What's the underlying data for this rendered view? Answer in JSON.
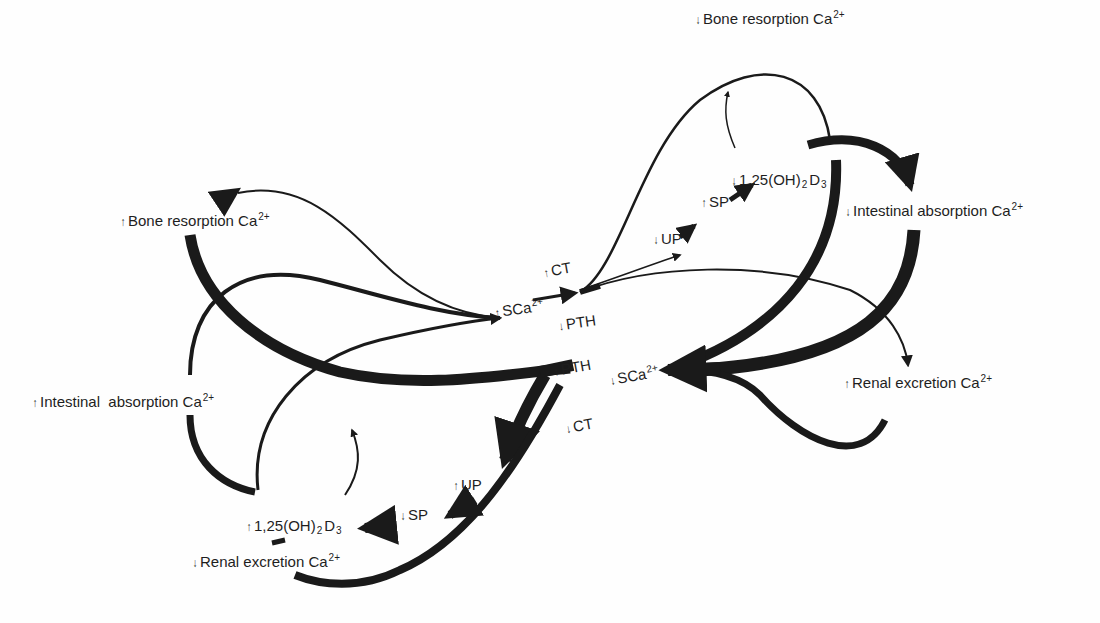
{
  "diagram": {
    "type": "feedback-loop-diagram",
    "upper_loop": {
      "center_node": {
        "arrow": "up",
        "text": "SCa",
        "superscript": "2+"
      },
      "hormone_up": {
        "arrow": "up",
        "text": "CT"
      },
      "hormone_down": {
        "arrow": "down",
        "text": "PTH"
      },
      "chain": [
        {
          "arrow": "down",
          "text": "UP"
        },
        {
          "arrow": "up",
          "text": "SP"
        },
        {
          "arrow": "down",
          "text": "1,25(OH)",
          "subscript": "2",
          "suffix": "D",
          "suffix_subscript": "3"
        }
      ],
      "effects": [
        {
          "arrow": "down",
          "text": "Bone resorption Ca",
          "superscript": "2+"
        },
        {
          "arrow": "down",
          "text": "Intestinal absorption Ca",
          "superscript": "2+"
        },
        {
          "arrow": "up",
          "text": "Renal excretion Ca",
          "superscript": "2+"
        }
      ]
    },
    "lower_loop": {
      "center_node": {
        "arrow": "down",
        "text": "SCa",
        "superscript": "2+"
      },
      "hormone_up": {
        "arrow": "up",
        "text": "PTH"
      },
      "hormone_down": {
        "arrow": "down",
        "text": "CT"
      },
      "chain": [
        {
          "arrow": "up",
          "text": "UP"
        },
        {
          "arrow": "down",
          "text": "SP"
        },
        {
          "arrow": "up",
          "text": "1,25(OH)",
          "subscript": "2",
          "suffix": "D",
          "suffix_subscript": "3"
        }
      ],
      "effects": [
        {
          "arrow": "up",
          "text": "Bone resorption Ca",
          "superscript": "2+"
        },
        {
          "arrow": "up",
          "text": "Intestinal  absorption Ca",
          "superscript": "2+"
        },
        {
          "arrow": "down",
          "text": "Renal excretion Ca",
          "superscript": "2+"
        }
      ]
    },
    "glyphs": {
      "up": "↑",
      "down": "↓"
    },
    "colors": {
      "ink": "#1a1a1a",
      "background": "#fefefe"
    }
  }
}
